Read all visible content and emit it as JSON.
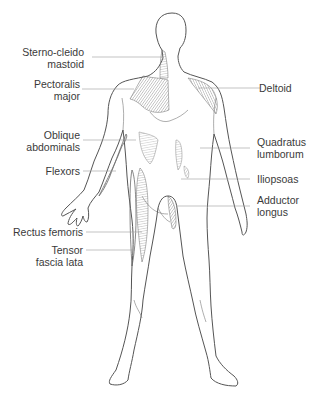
{
  "diagram": {
    "type": "anatomical-figure",
    "colors": {
      "outline": "#555555",
      "muscle": "#8a8a8a",
      "leader": "#9a9a9a",
      "text": "#3a3a3a"
    },
    "labels_left": [
      {
        "id": "sternocleidomastoid",
        "line1": "Sterno-cleido",
        "line2": "mastoid"
      },
      {
        "id": "pectoralis-major",
        "line1": "Pectoralis",
        "line2": "major"
      },
      {
        "id": "oblique-abdominals",
        "line1": "Oblique",
        "line2": "abdominals"
      },
      {
        "id": "flexors",
        "line1": "Flexors",
        "line2": ""
      },
      {
        "id": "rectus-femoris",
        "line1": "Rectus femoris",
        "line2": ""
      },
      {
        "id": "tensor-fascia-lata",
        "line1": "Tensor",
        "line2": "fascia lata"
      }
    ],
    "labels_right": [
      {
        "id": "deltoid",
        "line1": "Deltoid",
        "line2": ""
      },
      {
        "id": "quadratus-lumborum",
        "line1": "Quadratus",
        "line2": "lumborum"
      },
      {
        "id": "iliopsoas",
        "line1": "Iliopsoas",
        "line2": ""
      },
      {
        "id": "adductor-longus",
        "line1": "Adductor",
        "line2": "longus"
      }
    ]
  }
}
